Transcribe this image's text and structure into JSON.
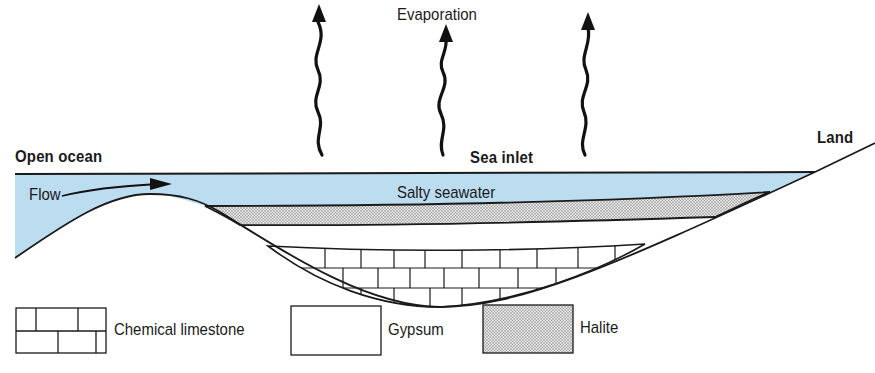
{
  "diagram": {
    "title_labels": {
      "evaporation": "Evaporation",
      "open_ocean": "Open ocean",
      "sea_inlet": "Sea inlet",
      "land": "Land",
      "flow": "Flow",
      "salty_seawater": "Salty seawater"
    },
    "legend": [
      {
        "pattern": "chemical-limestone",
        "label": "Chemical limestone"
      },
      {
        "pattern": "gypsum",
        "label": "Gypsum"
      },
      {
        "pattern": "halite",
        "label": "Halite"
      }
    ],
    "colors": {
      "water": "#bcdcf0",
      "line": "#1a1a1a",
      "halite": "#cfcfcf",
      "background": "#ffffff"
    },
    "arrows": {
      "evaporation_count": 3,
      "flow_direction": "right"
    }
  }
}
